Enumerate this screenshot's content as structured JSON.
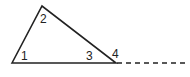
{
  "diagram": {
    "type": "triangle-exterior-angle",
    "colors": {
      "stroke": "#222222",
      "background": "#ffffff"
    },
    "vertices": {
      "left": [
        12,
        63
      ],
      "apex": [
        42,
        6
      ],
      "right": [
        116,
        63
      ]
    },
    "extension": {
      "from": [
        116,
        63
      ],
      "to": [
        188,
        63
      ],
      "style": "dashed"
    },
    "angle_labels": [
      {
        "id": "1",
        "text": "1",
        "x": 21,
        "y": 50
      },
      {
        "id": "2",
        "text": "2",
        "x": 40,
        "y": 13
      },
      {
        "id": "3",
        "text": "3",
        "x": 86,
        "y": 50
      },
      {
        "id": "4",
        "text": "4",
        "x": 112,
        "y": 48
      }
    ]
  }
}
